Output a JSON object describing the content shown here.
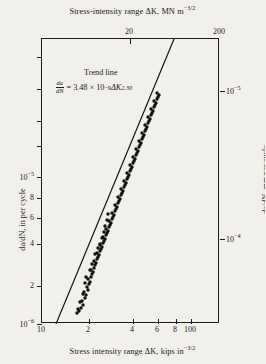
{
  "chart_data": {
    "type": "scatter",
    "title": "",
    "top_axis": {
      "label": "Stress-intensity range ΔK, MN m",
      "label_exp": "−3/2",
      "ticks": [
        {
          "value": 20,
          "label": "20",
          "x_px": 88
        },
        {
          "value": 200,
          "label": "200",
          "x_px": 178
        }
      ],
      "range": [
        10,
        220
      ]
    },
    "bottom_axis": {
      "label": "Stress intensity range ΔK, kips in",
      "label_exp": "−3/2",
      "ticks": [
        {
          "value": 10,
          "label": "10",
          "x_px": 0
        },
        {
          "value": 20,
          "label": "2",
          "x_px": 47
        },
        {
          "value": 40,
          "label": "4",
          "x_px": 91
        },
        {
          "value": 60,
          "label": "6",
          "x_px": 116
        },
        {
          "value": 80,
          "label": "8",
          "x_px": 134
        },
        {
          "value": 100,
          "label": "100",
          "x_px": 149
        }
      ],
      "range": [
        10,
        200
      ]
    },
    "left_axis": {
      "label": "da/dN, in per cycle",
      "ticks": [
        {
          "value": 1e-05,
          "label": "10",
          "exp": "−5",
          "y_px": 138
        },
        {
          "value": 8e-06,
          "label": "8",
          "exp": "",
          "y_px": 159
        },
        {
          "value": 6e-06,
          "label": "6",
          "exp": "",
          "y_px": 179
        },
        {
          "value": 4e-06,
          "label": "4",
          "exp": "",
          "y_px": 205
        },
        {
          "value": 2e-06,
          "label": "2",
          "exp": "",
          "y_px": 247
        },
        {
          "value": 1e-06,
          "label": "10",
          "exp": "−6",
          "y_px": 285
        }
      ],
      "untitled_ticks_y_px": [
        18,
        50,
        82,
        107
      ],
      "range": [
        1e-06,
        3e-05
      ]
    },
    "right_axis": {
      "label": "da/dN, mm per cycle",
      "ticks": [
        {
          "value": 0.0001,
          "label": "10",
          "exp": "−5",
          "y_px": 52
        },
        {
          "value": 1e-05,
          "label": "10",
          "exp": "−4",
          "y_px": 200
        }
      ],
      "range": [
        2.5e-05,
        0.00076
      ]
    },
    "trend_line": {
      "name": "Trend line",
      "label": "Trend line",
      "equation_lhs_num": "da",
      "equation_lhs_den": "dN",
      "equation_rhs_prefix": "= 3.48 × 10",
      "equation_rhs_exp1": "−9",
      "equation_rhs_mid": "ΔK",
      "equation_rhs_exp2": "2.30",
      "coefficient": 3.48e-09,
      "exponent": 2.3,
      "endpoints_px": [
        [
          14,
          285
        ],
        [
          132,
          0
        ]
      ]
    },
    "series": [
      {
        "name": "fatigue crack growth data",
        "marker": "filled-circle",
        "color": "#101010",
        "points_px": [
          [
            37,
            272
          ],
          [
            39,
            269
          ],
          [
            41,
            266
          ],
          [
            40,
            262
          ],
          [
            43,
            259
          ],
          [
            44,
            256
          ],
          [
            42,
            253
          ],
          [
            46,
            251
          ],
          [
            45,
            248
          ],
          [
            47,
            245
          ],
          [
            48,
            243
          ],
          [
            46,
            240
          ],
          [
            49,
            238
          ],
          [
            50,
            235
          ],
          [
            51,
            233
          ],
          [
            49,
            231
          ],
          [
            52,
            229
          ],
          [
            53,
            226
          ],
          [
            54,
            224
          ],
          [
            52,
            222
          ],
          [
            55,
            220
          ],
          [
            56,
            218
          ],
          [
            57,
            216
          ],
          [
            55,
            214
          ],
          [
            58,
            212
          ],
          [
            59,
            210
          ],
          [
            60,
            208
          ],
          [
            58,
            206
          ],
          [
            61,
            204
          ],
          [
            62,
            202
          ],
          [
            63,
            200
          ],
          [
            61,
            198
          ],
          [
            64,
            196
          ],
          [
            65,
            194
          ],
          [
            66,
            192
          ],
          [
            64,
            190
          ],
          [
            67,
            188
          ],
          [
            68,
            186
          ],
          [
            69,
            184
          ],
          [
            67,
            182
          ],
          [
            70,
            180
          ],
          [
            71,
            178
          ],
          [
            72,
            176
          ],
          [
            70,
            174
          ],
          [
            73,
            172
          ],
          [
            74,
            170
          ],
          [
            75,
            168
          ],
          [
            73,
            166
          ],
          [
            76,
            164
          ],
          [
            77,
            162
          ],
          [
            78,
            160
          ],
          [
            76,
            158
          ],
          [
            79,
            156
          ],
          [
            80,
            154
          ],
          [
            81,
            152
          ],
          [
            79,
            150
          ],
          [
            82,
            148
          ],
          [
            83,
            146
          ],
          [
            84,
            144
          ],
          [
            82,
            142
          ],
          [
            85,
            140
          ],
          [
            86,
            138
          ],
          [
            87,
            136
          ],
          [
            85,
            134
          ],
          [
            88,
            132
          ],
          [
            89,
            130
          ],
          [
            90,
            128
          ],
          [
            88,
            126
          ],
          [
            91,
            124
          ],
          [
            92,
            122
          ],
          [
            93,
            120
          ],
          [
            91,
            118
          ],
          [
            94,
            116
          ],
          [
            95,
            114
          ],
          [
            96,
            112
          ],
          [
            94,
            110
          ],
          [
            97,
            108
          ],
          [
            98,
            106
          ],
          [
            99,
            104
          ],
          [
            97,
            102
          ],
          [
            100,
            100
          ],
          [
            101,
            98
          ],
          [
            102,
            96
          ],
          [
            100,
            94
          ],
          [
            103,
            92
          ],
          [
            104,
            90
          ],
          [
            105,
            88
          ],
          [
            103,
            86
          ],
          [
            106,
            84
          ],
          [
            107,
            82
          ],
          [
            108,
            80
          ],
          [
            106,
            78
          ],
          [
            109,
            76
          ],
          [
            110,
            74
          ],
          [
            111,
            72
          ],
          [
            109,
            70
          ],
          [
            112,
            68
          ],
          [
            113,
            66
          ],
          [
            114,
            64
          ],
          [
            112,
            62
          ],
          [
            115,
            60
          ],
          [
            116,
            58
          ],
          [
            117,
            56
          ],
          [
            115,
            54
          ],
          [
            63,
            187
          ],
          [
            65,
            181
          ],
          [
            62,
            193
          ],
          [
            60,
            199
          ],
          [
            66,
            175
          ],
          [
            58,
            205
          ],
          [
            41,
            255
          ],
          [
            43,
            244
          ],
          [
            44,
            238
          ],
          [
            38,
            263
          ],
          [
            36,
            270
          ],
          [
            35,
            274
          ],
          [
            53,
            215
          ],
          [
            56,
            209
          ],
          [
            50,
            225
          ],
          [
            48,
            231
          ]
        ]
      }
    ],
    "grid": false,
    "legend": "none"
  }
}
